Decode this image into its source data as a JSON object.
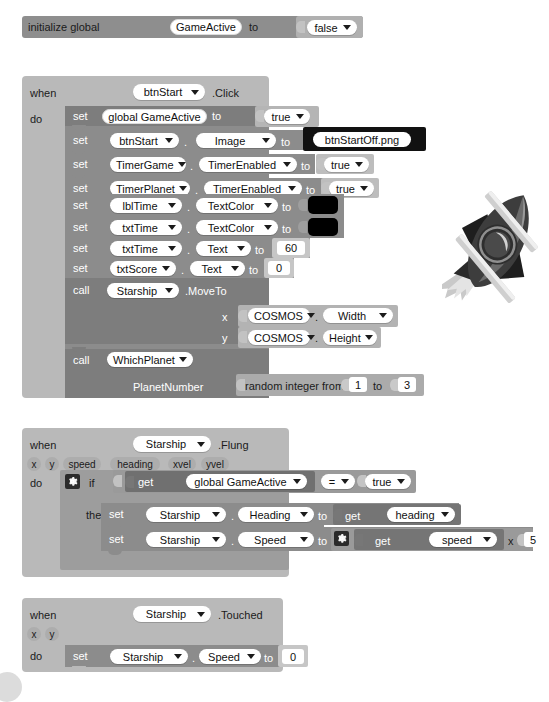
{
  "app": {
    "name": "MIT App Inventor Blocks Editor",
    "theme": "grayscale"
  },
  "global_init": {
    "keyword_initialize": "initialize global",
    "variable_name": "GameActive",
    "keyword_to": "to",
    "value": "false"
  },
  "blocks": [
    {
      "id": "btnstart-click",
      "keyword_when": "when",
      "component": "btnStart",
      "event": ".Click",
      "keyword_do": "do",
      "statements": [
        {
          "kind": "set-global",
          "keyword": "set",
          "target": "global GameActive",
          "to": "to",
          "value": "true"
        },
        {
          "kind": "set-prop",
          "keyword": "set",
          "component": "btnStart",
          "dot": ".",
          "property": "Image",
          "to": "to",
          "value": "btnStartOff.png",
          "value_type": "text"
        },
        {
          "kind": "set-prop",
          "keyword": "set",
          "component": "TimerGame",
          "dot": ".",
          "property": "TimerEnabled",
          "to": "to",
          "value": "true",
          "value_type": "logic"
        },
        {
          "kind": "set-prop",
          "keyword": "set",
          "component": "TimerPlanet",
          "dot": ".",
          "property": "TimerEnabled",
          "to": "to",
          "value": "true",
          "value_type": "logic"
        },
        {
          "kind": "set-prop",
          "keyword": "set",
          "component": "lblTime",
          "dot": ".",
          "property": "TextColor",
          "to": "to",
          "value": "#000000",
          "value_type": "color"
        },
        {
          "kind": "set-prop",
          "keyword": "set",
          "component": "txtTime",
          "dot": ".",
          "property": "TextColor",
          "to": "to",
          "value": "#000000",
          "value_type": "color"
        },
        {
          "kind": "set-prop",
          "keyword": "set",
          "component": "txtTime",
          "dot": ".",
          "property": "Text",
          "to": "to",
          "value": "60",
          "value_type": "number"
        },
        {
          "kind": "set-prop",
          "keyword": "set",
          "component": "txtScore",
          "dot": ".",
          "property": "Text",
          "to": "to",
          "value": "0",
          "value_type": "number"
        },
        {
          "kind": "call",
          "keyword": "call",
          "component": "Starship",
          "method": ".MoveTo",
          "args": [
            {
              "name": "x",
              "component": "COSMOS",
              "dot": ".",
              "property": "Width"
            },
            {
              "name": "y",
              "component": "COSMOS",
              "dot": ".",
              "property": "Height"
            }
          ]
        },
        {
          "kind": "call",
          "keyword": "call",
          "procedure": "WhichPlanet",
          "args": [
            {
              "name": "PlanetNumber",
              "expression": "random integer from",
              "from": "1",
              "to_label": "to",
              "to": "3"
            }
          ]
        }
      ]
    },
    {
      "id": "starship-flung",
      "keyword_when": "when",
      "component": "Starship",
      "event": ".Flung",
      "params": [
        "x",
        "y",
        "speed",
        "heading",
        "xvel",
        "yvel"
      ],
      "keyword_do": "do",
      "if_label": "if",
      "then_label": "then",
      "condition": {
        "get_label": "get",
        "variable": "global GameActive",
        "operator": "=",
        "compare_to": "true"
      },
      "then_statements": [
        {
          "kind": "set-prop",
          "keyword": "set",
          "component": "Starship",
          "dot": ".",
          "property": "Heading",
          "to": "to",
          "value_type": "get",
          "get_label": "get",
          "value": "heading"
        },
        {
          "kind": "set-prop",
          "keyword": "set",
          "component": "Starship",
          "dot": ".",
          "property": "Speed",
          "to": "to",
          "value_type": "multiply",
          "get_label": "get",
          "value": "speed",
          "operator": "x",
          "operand": "5"
        }
      ]
    },
    {
      "id": "starship-touched",
      "keyword_when": "when",
      "component": "Starship",
      "event": ".Touched",
      "params": [
        "x",
        "y"
      ],
      "keyword_do": "do",
      "statements": [
        {
          "kind": "set-prop",
          "keyword": "set",
          "component": "Starship",
          "dot": ".",
          "property": "Speed",
          "to": "to",
          "value": "0",
          "value_type": "number"
        }
      ]
    }
  ],
  "decorations": {
    "rocket_image": "rocket-sprite",
    "corner_ball": "circle-decoration"
  }
}
